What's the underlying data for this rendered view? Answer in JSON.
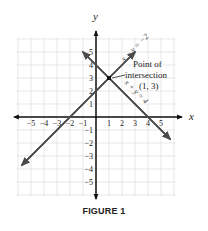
{
  "chart_data": {
    "type": "line",
    "title": "",
    "caption": "FIGURE 1",
    "xlabel": "x",
    "ylabel": "y",
    "xlim": [
      -6,
      6
    ],
    "ylim": [
      -6,
      6
    ],
    "grid": true,
    "x_ticks": [
      -5,
      -4,
      -3,
      -2,
      -1,
      1,
      2,
      3,
      4,
      5
    ],
    "y_ticks": [
      5,
      4,
      3,
      2,
      1,
      -1,
      -2,
      -3,
      -4,
      -5
    ],
    "x_tick_labels": [
      "−5",
      "−4",
      "−3",
      "−2",
      "−1",
      "1",
      "2",
      "3",
      "4",
      "5"
    ],
    "y_tick_labels": [
      "5",
      "4",
      "3",
      "2",
      "1",
      "−1",
      "−2",
      "−3",
      "−4",
      "−5"
    ],
    "series": [
      {
        "name": "x − y = −2",
        "equation": "y = x + 2",
        "x": [
          -5.7,
          3.0
        ],
        "y": [
          -3.7,
          5.0
        ]
      },
      {
        "name": "x + y = 4",
        "equation": "y = -x + 4",
        "x": [
          -1.0,
          5.7
        ],
        "y": [
          5.0,
          -1.7
        ]
      }
    ],
    "annotations": [
      {
        "text": "Point of intersection",
        "point": [
          1,
          3
        ],
        "label": "(1, 3)"
      }
    ]
  },
  "labels": {
    "x_axis": "x",
    "y_axis": "y",
    "line1": "x − y = −2",
    "line2": "x + y = 4",
    "annot_line1": "Point of",
    "annot_line2": "intersection",
    "annot_point": "(1, 3)",
    "caption": "FIGURE 1"
  },
  "colors": {
    "line": "#4a4a4a",
    "grid": "#d8d8d8",
    "axis": "#111111",
    "text": "#222222"
  }
}
